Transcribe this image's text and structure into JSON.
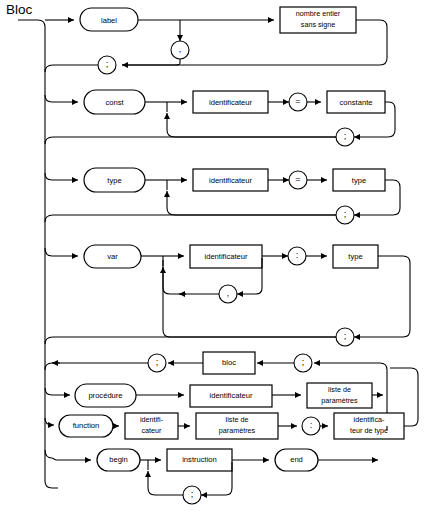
{
  "diagram": {
    "title": "Bloc",
    "type": "syntax-railroad-diagram",
    "language": "fr",
    "colors": {
      "stroke": "#000000",
      "background": "#ffffff",
      "text": "#000000"
    },
    "canvas": {
      "width": 434,
      "height": 513
    },
    "sections": [
      {
        "id": "label-section",
        "keyword": "label",
        "items": [
          "nombre entier sans signe"
        ],
        "repeat_separator": ",",
        "terminator": ";"
      },
      {
        "id": "const-section",
        "keyword": "const",
        "items": [
          "identificateur",
          "=",
          "constante"
        ],
        "terminator": ";"
      },
      {
        "id": "type-section",
        "keyword": "type",
        "items": [
          "identificateur",
          "=",
          "type"
        ],
        "terminator": ";"
      },
      {
        "id": "var-section",
        "keyword": "var",
        "items": [
          "identificateur",
          ":",
          "type"
        ],
        "repeat_separator": ",",
        "terminator": ";"
      },
      {
        "id": "bloc-return-row",
        "items": [
          ";",
          "bloc",
          ";"
        ]
      },
      {
        "id": "procedure-section",
        "keyword": "procédure",
        "items": [
          "identificateur",
          "liste de paramètres"
        ]
      },
      {
        "id": "function-section",
        "keyword": "function",
        "items": [
          "identifi-",
          "cateur",
          "liste de",
          "paramètres",
          ":",
          "identifica-",
          "teur de type"
        ]
      },
      {
        "id": "begin-end-section",
        "keyword": "begin",
        "items": [
          "instruction",
          "end"
        ],
        "repeat_separator": ";"
      }
    ],
    "nodes": {
      "label_kw": "label",
      "nombre_entier_l1": "nombre entier",
      "nombre_entier_l2": "sans signe",
      "const_kw": "const",
      "identificateur_1": "identificateur",
      "equals_1": "=",
      "constante": "constante",
      "type_kw": "type",
      "identificateur_2": "identificateur",
      "equals_2": "=",
      "type_box_1": "type",
      "var_kw": "var",
      "identificateur_3": "identificateur",
      "colon_var": ":",
      "type_box_2": "type",
      "bloc_box": "bloc",
      "procedure_kw": "procédure",
      "identificateur_4": "identificateur",
      "liste_param_1_l1": "liste de",
      "liste_param_1_l2": "paramètres",
      "function_kw": "function",
      "identif_l1": "identifi-",
      "identif_l2": "cateur",
      "liste_param_2_l1": "liste de",
      "liste_param_2_l2": "paramètres",
      "colon_func": ":",
      "ident_type_l1": "identifica-",
      "ident_type_l2": "teur de type",
      "begin_kw": "begin",
      "instruction_box": "instruction",
      "end_kw": "end",
      "comma_label": ",",
      "semi_label": ";",
      "semi_const": ";",
      "semi_type": ";",
      "comma_var": ",",
      "semi_var": ";",
      "semi_bloc_left": ";",
      "semi_bloc_right": ";",
      "semi_instruction": ";"
    }
  }
}
